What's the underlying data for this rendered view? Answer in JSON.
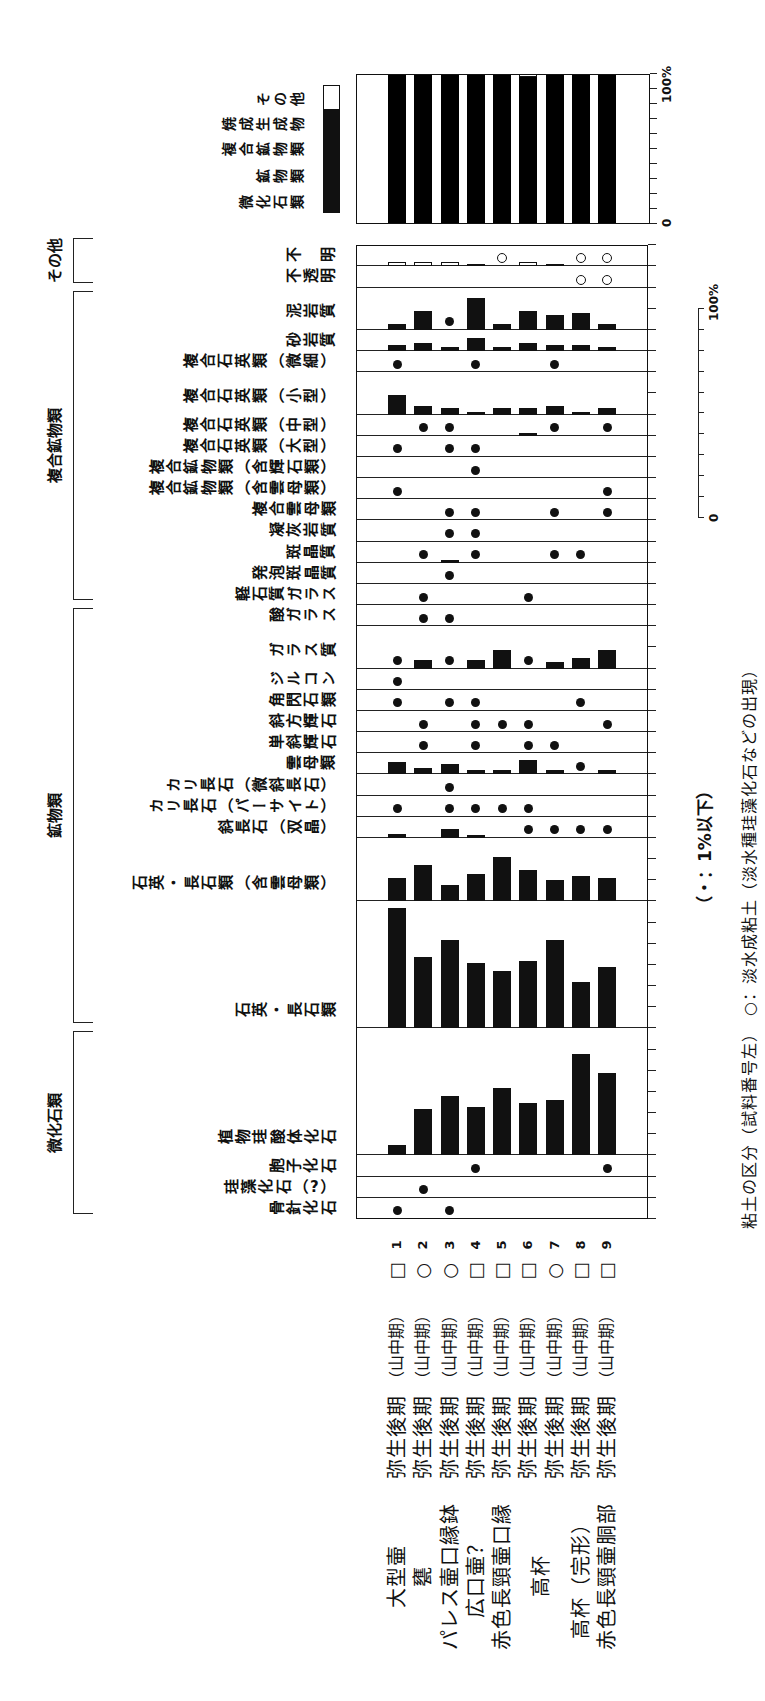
{
  "figure": {
    "footnote": "（・：1%以下）",
    "caption": "粘土の区分（試料番号左）　○：淡水成粘土（淡水種珪藻化石などの出現）"
  },
  "samples": [
    {
      "no": "1",
      "clay": "□",
      "period": "弥生後期",
      "phase": "（山中期）",
      "vessel": "大型壷"
    },
    {
      "no": "2",
      "clay": "○",
      "period": "弥生後期",
      "phase": "（山中期）",
      "vessel": "甕"
    },
    {
      "no": "3",
      "clay": "○",
      "period": "弥生後期",
      "phase": "（山中期）",
      "vessel": "パレス壷口縁鉢"
    },
    {
      "no": "4",
      "clay": "□",
      "period": "弥生後期",
      "phase": "（山中期）",
      "vessel": "広口壷？"
    },
    {
      "no": "5",
      "clay": "□",
      "period": "弥生後期",
      "phase": "（山中期）",
      "vessel": "赤色長頸壷口縁"
    },
    {
      "no": "6",
      "clay": "□",
      "period": "弥生後期",
      "phase": "（山中期）",
      "vessel": "高杯",
      "vessel_rows": 2
    },
    {
      "no": "7",
      "clay": "○",
      "period": "弥生後期",
      "phase": "（山中期）",
      "vessel": ""
    },
    {
      "no": "8",
      "clay": "□",
      "period": "弥生後期",
      "phase": "（山中期）",
      "vessel": "高杯（完形）"
    },
    {
      "no": "9",
      "clay": "□",
      "period": "弥生後期",
      "phase": "（山中期）",
      "vessel": "赤色長頸壷胴部"
    }
  ],
  "chart_data": [
    {
      "type": "bar",
      "title": "",
      "layout": "rows = samples 1-9, columns = constituent categories, horizontal bars per cell",
      "value_unit": "%",
      "row_labels": [
        "1",
        "2",
        "3",
        "4",
        "5",
        "6",
        "7",
        "8",
        "9"
      ],
      "dot_meaning": "・：1%以下",
      "scale_bar": {
        "min_label": "0",
        "max_label": "100%",
        "ticks": 10
      },
      "groups": [
        {
          "name": "微化石類",
          "from": 0,
          "to": 3
        },
        {
          "name": "鉱物類",
          "from": 4,
          "to": 15
        },
        {
          "name": "複合鉱物類",
          "from": 16,
          "to": 28
        },
        {
          "name": "その他",
          "from": 29,
          "to": 30
        }
      ],
      "columns": [
        {
          "name": "骨針化石",
          "units": 1,
          "values": [
            "●",
            null,
            "●",
            null,
            null,
            null,
            null,
            null,
            null
          ]
        },
        {
          "name": "珪藻化石（?）",
          "units": 1,
          "values": [
            null,
            "●",
            null,
            null,
            null,
            null,
            null,
            null,
            null
          ]
        },
        {
          "name": "胞子化石",
          "units": 1,
          "values": [
            null,
            null,
            null,
            "●",
            null,
            null,
            null,
            null,
            "●"
          ]
        },
        {
          "name": "植物珪酸体化石",
          "units": 6,
          "values": [
            5,
            22,
            28,
            23,
            32,
            25,
            26,
            48,
            39
          ]
        },
        {
          "name": "石英・長石類",
          "units": 6,
          "values": [
            57,
            34,
            42,
            31,
            27,
            32,
            42,
            22,
            29
          ]
        },
        {
          "name": "石英・長石類（含雲母類）",
          "units": 3,
          "values": [
            11,
            17,
            8,
            13,
            21,
            15,
            10,
            12,
            11
          ]
        },
        {
          "name": "斜長石（双晶）",
          "units": 1,
          "values": [
            2,
            null,
            4,
            1,
            null,
            "●",
            "●",
            "●",
            "●"
          ]
        },
        {
          "name": "カリ長石（パーサイト）",
          "units": 1,
          "values": [
            "●",
            null,
            "●",
            "●",
            "●",
            "●",
            null,
            null,
            null
          ]
        },
        {
          "name": "カリ長石（微斜長石）",
          "units": 1,
          "values": [
            null,
            null,
            "●",
            null,
            null,
            null,
            null,
            null,
            null
          ]
        },
        {
          "name": "雲母類",
          "units": 1,
          "values": [
            6,
            3,
            5,
            2,
            2,
            7,
            2,
            "●",
            2
          ]
        },
        {
          "name": "単斜輝石",
          "units": 1,
          "values": [
            null,
            "●",
            null,
            "●",
            null,
            "●",
            "●",
            null,
            null
          ]
        },
        {
          "name": "斜方輝石",
          "units": 1,
          "values": [
            null,
            "●",
            null,
            "●",
            "●",
            "●",
            null,
            null,
            "●"
          ]
        },
        {
          "name": "角閃石類",
          "units": 1,
          "values": [
            "●",
            null,
            "●",
            "●",
            null,
            null,
            null,
            "●",
            null
          ]
        },
        {
          "name": "ジルコン",
          "units": 1,
          "values": [
            "●",
            null,
            null,
            null,
            null,
            null,
            null,
            null,
            null
          ]
        },
        {
          "name": "ガラス質",
          "units": 2,
          "values": [
            "●",
            4,
            "●",
            4,
            9,
            "●",
            3,
            5,
            9
          ]
        },
        {
          "name": "酸ガラス",
          "units": 1,
          "values": [
            null,
            "●",
            "●",
            null,
            null,
            null,
            null,
            null,
            null
          ]
        },
        {
          "name": "軽石質ガラス",
          "units": 1,
          "values": [
            null,
            "●",
            null,
            null,
            null,
            "●",
            null,
            null,
            null
          ]
        },
        {
          "name": "発泡斑晶質",
          "units": 1,
          "values": [
            null,
            null,
            "●",
            null,
            null,
            null,
            null,
            null,
            null
          ]
        },
        {
          "name": "斑晶質",
          "units": 1,
          "values": [
            null,
            "●",
            1,
            "●",
            null,
            null,
            "●",
            "●",
            null
          ]
        },
        {
          "name": "凝灰岩質",
          "units": 1,
          "values": [
            null,
            null,
            "●",
            "●",
            null,
            null,
            null,
            null,
            null
          ]
        },
        {
          "name": "複合雲母類",
          "units": 1,
          "values": [
            null,
            null,
            "●",
            "●",
            null,
            null,
            "●",
            null,
            "●"
          ]
        },
        {
          "name": "複合鉱物類（含雲母類）",
          "units": 1,
          "values": [
            "●",
            null,
            null,
            null,
            null,
            null,
            null,
            null,
            "●"
          ]
        },
        {
          "name": "複合鉱物類（含輝石類）",
          "units": 1,
          "values": [
            null,
            null,
            null,
            "●",
            null,
            null,
            null,
            null,
            null
          ]
        },
        {
          "name": "複合石英類（大型）",
          "units": 1,
          "values": [
            "●",
            null,
            "●",
            "●",
            null,
            null,
            null,
            null,
            null
          ]
        },
        {
          "name": "複合石英類（中型）",
          "units": 1,
          "values": [
            null,
            "●",
            "●",
            null,
            null,
            1,
            "●",
            null,
            "●"
          ]
        },
        {
          "name": "複合石英類（小型）",
          "units": 2,
          "values": [
            9,
            4,
            3,
            1,
            3,
            3,
            4,
            1,
            3
          ]
        },
        {
          "name": "複合石英類（微細）",
          "units": 1,
          "values": [
            "●",
            null,
            null,
            "●",
            null,
            null,
            "●",
            null,
            null
          ]
        },
        {
          "name": "砂岩質",
          "units": 1,
          "values": [
            3,
            4,
            2,
            6,
            2,
            4,
            3,
            3,
            2
          ]
        },
        {
          "name": "泥岩質",
          "units": 2,
          "values": [
            3,
            9,
            "●",
            15,
            3,
            9,
            7,
            8,
            3
          ]
        },
        {
          "name": "不透明",
          "units": 1,
          "values": [
            null,
            null,
            null,
            null,
            null,
            null,
            null,
            "○",
            "○"
          ]
        },
        {
          "name": "不　明",
          "units": 1,
          "fill": "white",
          "values": [
            2,
            2,
            2,
            1,
            "○",
            2,
            1,
            "○",
            "○"
          ]
        }
      ]
    },
    {
      "type": "bar",
      "stacked": true,
      "orientation": "horizontal",
      "title": "",
      "categories": [
        "1",
        "2",
        "3",
        "4",
        "5",
        "6",
        "7",
        "8",
        "9"
      ],
      "series": [
        {
          "name": "焼成生成物・複合鉱物類・鉱物類・微化石類",
          "color": "#000000",
          "values": [
            100,
            100,
            100,
            100,
            100,
            98,
            100,
            100,
            100
          ]
        },
        {
          "name": "その他",
          "color": "#ffffff",
          "values": [
            0,
            0,
            0,
            0,
            0,
            2,
            0,
            0,
            0
          ]
        }
      ],
      "xlim": [
        0,
        100
      ],
      "ticks": 10,
      "tick_labels": {
        "min": "0",
        "max": "100%"
      },
      "legend": [
        {
          "label": "その他",
          "color": "#ffffff"
        },
        {
          "label": "焼成生成物",
          "color": "#000000"
        },
        {
          "label": "複合鉱物類",
          "color": "#000000"
        },
        {
          "label": "鉱物類",
          "color": "#000000"
        },
        {
          "label": "微化石類",
          "color": "#000000"
        }
      ]
    }
  ]
}
